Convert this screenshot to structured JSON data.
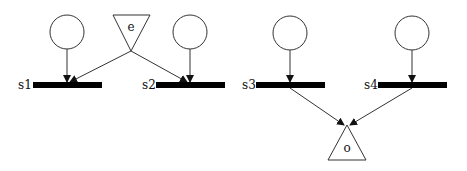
{
  "diagram": {
    "type": "petri-net",
    "colors": {
      "stroke": "#333333",
      "bar": "#000000",
      "background": "#ffffff"
    },
    "places": [
      {
        "id": "p1",
        "cx": 67,
        "cy": 32,
        "r": 17
      },
      {
        "id": "p2",
        "cx": 190,
        "cy": 32,
        "r": 17
      },
      {
        "id": "p3",
        "cx": 290,
        "cy": 33,
        "r": 17
      },
      {
        "id": "p4",
        "cx": 412,
        "cy": 33,
        "r": 17
      }
    ],
    "transitions": [
      {
        "id": "s1",
        "label": "s1",
        "x": 33,
        "y": 82,
        "w": 69,
        "h": 6,
        "label_x": 18,
        "label_y": 89
      },
      {
        "id": "s2",
        "label": "s2",
        "x": 156,
        "y": 82,
        "w": 69,
        "h": 6,
        "label_x": 142,
        "label_y": 89
      },
      {
        "id": "s3",
        "label": "s3",
        "x": 256,
        "y": 82,
        "w": 69,
        "h": 6,
        "label_x": 242,
        "label_y": 89
      },
      {
        "id": "s4",
        "label": "s4",
        "x": 378,
        "y": 82,
        "w": 69,
        "h": 6,
        "label_x": 364,
        "label_y": 89
      }
    ],
    "triangles": [
      {
        "id": "e",
        "label": "e",
        "points": "113,15 150,15 131,51",
        "label_x": 131,
        "label_y": 31
      },
      {
        "id": "o",
        "label": "o",
        "points": "347,125 328,160 366,160",
        "label_x": 347,
        "label_y": 152
      }
    ],
    "arcs": [
      {
        "from": "p1",
        "to": "s1",
        "x1": 67,
        "y1": 49,
        "x2": 67,
        "y2": 82
      },
      {
        "from": "e",
        "to": "s1",
        "x1": 131,
        "y1": 51,
        "x2": 70,
        "y2": 82
      },
      {
        "from": "e",
        "to": "s2",
        "x1": 131,
        "y1": 51,
        "x2": 187,
        "y2": 82
      },
      {
        "from": "p2",
        "to": "s2",
        "x1": 190,
        "y1": 49,
        "x2": 190,
        "y2": 82
      },
      {
        "from": "p3",
        "to": "s3",
        "x1": 290,
        "y1": 50,
        "x2": 290,
        "y2": 82
      },
      {
        "from": "p4",
        "to": "s4",
        "x1": 412,
        "y1": 50,
        "x2": 412,
        "y2": 82
      },
      {
        "from": "s3",
        "to": "o",
        "x1": 290,
        "y1": 88,
        "x2": 344,
        "y2": 125
      },
      {
        "from": "s4",
        "to": "o",
        "x1": 412,
        "y1": 88,
        "x2": 350,
        "y2": 125
      }
    ]
  }
}
